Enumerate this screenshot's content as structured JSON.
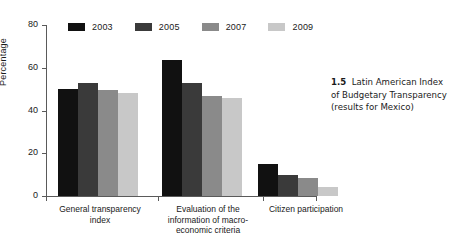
{
  "figure": {
    "caption_number": "1.5",
    "caption_text": "Latin American Index of Budgetary Transparency (results for Mexico)"
  },
  "chart_data": {
    "type": "bar",
    "title": "",
    "xlabel": "",
    "ylabel": "Percentage",
    "ylim": [
      0,
      80
    ],
    "yticks": [
      0,
      20,
      40,
      60,
      80
    ],
    "ytick_labels": [
      "0",
      "20",
      "40",
      "60",
      "80"
    ],
    "grid": false,
    "legend_position": "top-left",
    "categories": [
      "General transparency index",
      "Evaluation of the information of macro-economic criteria",
      "Citizen participation"
    ],
    "category_lines": [
      [
        "General transparency",
        "index"
      ],
      [
        "Evaluation of the",
        "information of macro-",
        "economic criteria"
      ],
      [
        "Citizen participation"
      ]
    ],
    "series": [
      {
        "name": "2003",
        "color": "#111111",
        "values": [
          50,
          63.5,
          15
        ]
      },
      {
        "name": "2005",
        "color": "#3a3a3a",
        "values": [
          53,
          53,
          10
        ]
      },
      {
        "name": "2007",
        "color": "#8a8a8a",
        "values": [
          49.5,
          47,
          8.5
        ]
      },
      {
        "name": "2009",
        "color": "#c8c8c8",
        "values": [
          48,
          46,
          4
        ]
      }
    ]
  }
}
